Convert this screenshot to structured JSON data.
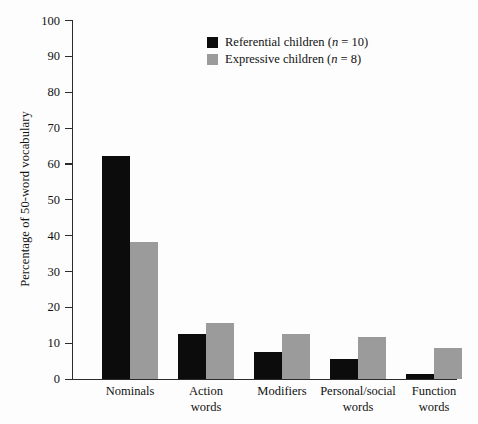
{
  "chart_data": {
    "type": "bar",
    "title": "",
    "xlabel": "",
    "ylabel": "Percentage of 50-word vocabulary",
    "ylim": [
      0,
      100
    ],
    "yticks": [
      0,
      10,
      20,
      30,
      40,
      50,
      60,
      70,
      80,
      90,
      100
    ],
    "grid": false,
    "legend_position": "top-center",
    "categories": [
      "Nominals",
      "Action\nwords",
      "Modifiers",
      "Personal/social\nwords",
      "Function\nwords"
    ],
    "series": [
      {
        "name": "Referential children (n = 10)",
        "label_prefix": "Referential children (",
        "label_italic": "n",
        "label_suffix": " = 10)",
        "color": "#0c0c0c",
        "values": [
          62,
          12.5,
          7.5,
          5.5,
          1.2
        ]
      },
      {
        "name": "Expressive children (n = 8)",
        "label_prefix": "Expressive children (",
        "label_italic": "n",
        "label_suffix": " = 8)",
        "color": "#9b9b9b",
        "values": [
          38,
          15.5,
          12.5,
          11.5,
          8.5
        ]
      }
    ]
  },
  "axis": {
    "tick_labels": [
      "0",
      "10",
      "20",
      "30",
      "40",
      "50",
      "60",
      "70",
      "80",
      "90",
      "100"
    ]
  },
  "colors": {
    "referential": "#0c0c0c",
    "expressive": "#9b9b9b",
    "axis": "#2b2b2b",
    "background": "#fdfdfd"
  }
}
